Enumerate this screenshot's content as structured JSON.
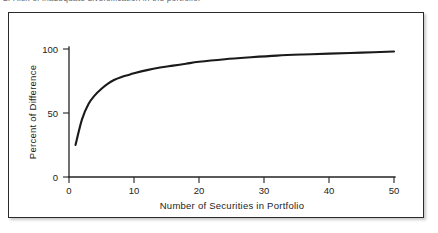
{
  "caption": {
    "text": "2. Risk of inadequate diversification in the portfolio."
  },
  "figure": {
    "name": "diversification-curve-figure",
    "border_color": "#2b2b2b",
    "background": "#ffffff"
  },
  "chart_data": {
    "type": "line",
    "title": "",
    "xlabel": "Number of Securities in Portfolio",
    "ylabel": "Percent of Difference",
    "xlim": [
      0,
      52
    ],
    "ylim": [
      0,
      108
    ],
    "xticks": [
      0,
      10,
      20,
      30,
      40,
      50
    ],
    "xticklabels": [
      "0",
      "10",
      "20",
      "30",
      "40",
      "50"
    ],
    "yticks": [
      0,
      50,
      100
    ],
    "yticklabels": [
      "0",
      "50",
      "100"
    ],
    "grid": false,
    "legend": null,
    "line_color": "#1a1a1a",
    "series": [
      {
        "name": "Percent of Difference",
        "x": [
          1,
          2,
          3,
          4,
          5,
          6,
          7,
          8,
          9,
          10,
          12,
          14,
          16,
          18,
          20,
          24,
          28,
          32,
          36,
          40,
          45,
          50
        ],
        "y": [
          25,
          45,
          57,
          64,
          69,
          73,
          76,
          78,
          79.5,
          81,
          83.5,
          85.5,
          87,
          88.5,
          90,
          92,
          93.5,
          94.8,
          95.7,
          96.4,
          97.2,
          98
        ]
      }
    ]
  }
}
